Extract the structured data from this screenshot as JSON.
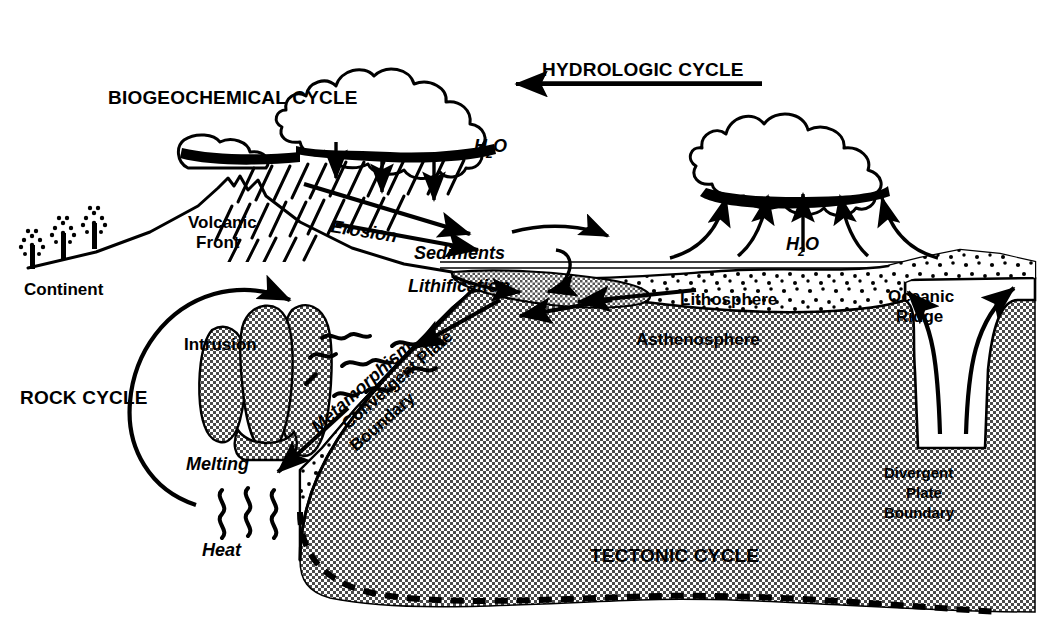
{
  "diagram": {
    "cycle_labels": {
      "biogeochemical": "BIOGEOCHEMICAL CYCLE",
      "hydrologic": "HYDROLOGIC CYCLE",
      "rock": "ROCK CYCLE",
      "tectonic": "TECTONIC CYCLE"
    },
    "feature_labels": {
      "continent": "Continent",
      "volcanic_front_line1": "Volcanic",
      "volcanic_front_line2": "Front",
      "erosion": "Erosion",
      "sediments": "Sediments",
      "lithification": "Lithification",
      "metamorphism": "Metamorphism",
      "intrusion": "Intrusion",
      "melting": "Melting",
      "heat": "Heat",
      "lithosphere": "Lithosphere",
      "asthenosphere": "Asthenosphere",
      "oceanic_ridge_line1": "Oceanic",
      "oceanic_ridge_line2": "Ridge",
      "convergent_line1": "Convergent Plate",
      "convergent_line2": "Boundary",
      "divergent_line1": "Divergent",
      "divergent_line2": "Plate",
      "divergent_line3": "Boundary"
    },
    "chemical_labels": {
      "water_rain": "H",
      "water_rain_sub": "2",
      "water_rain_tail": "O",
      "water_evap": "H",
      "water_evap_sub": "2",
      "water_evap_tail": "O"
    },
    "colors": {
      "ink": "#000000",
      "paper": "#ffffff",
      "asthenosphere_fill": "#9a9a9a",
      "sediment_fill": "#a8a8a8",
      "intrusion_fill": "#a0a0a0",
      "lithosphere_fill": "#ffffff"
    }
  }
}
